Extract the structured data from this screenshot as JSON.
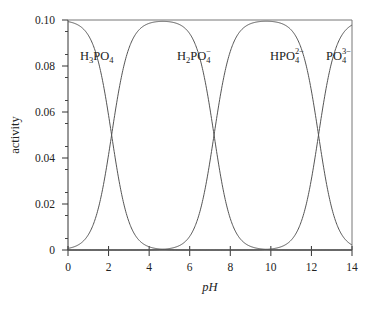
{
  "chart_data": {
    "type": "line",
    "title": "",
    "xlabel": "pH",
    "ylabel": "activity",
    "xlim": [
      0,
      14
    ],
    "ylim": [
      0,
      0.1
    ],
    "grid": false,
    "legend": "inline labels",
    "x_ticks": [
      0,
      2,
      4,
      6,
      8,
      10,
      12,
      14
    ],
    "x_tick_labels": [
      "0",
      "2",
      "4",
      "6",
      "8",
      "10",
      "12",
      "14"
    ],
    "y_ticks": [
      0,
      0.02,
      0.04,
      0.06,
      0.08,
      0.1
    ],
    "y_tick_labels": [
      "0",
      "0.02",
      "0.04",
      "0.06",
      "0.08",
      "0.10"
    ],
    "total_concentration": 0.1,
    "pKa": [
      2.15,
      7.2,
      12.35
    ],
    "series": [
      {
        "name": "H3PO4",
        "label_main": "H",
        "label_sub1": "3",
        "label_mid": "PO",
        "label_sub2": "4",
        "label_sup": "",
        "x": [
          0,
          1,
          2,
          2.15,
          3,
          4,
          5,
          6,
          7,
          8,
          10,
          12,
          14
        ],
        "values": [
          0.0993,
          0.0934,
          0.0585,
          0.05,
          0.0124,
          0.0014,
          0.0001,
          0.0,
          0.0,
          0.0,
          0.0,
          0.0,
          0.0
        ]
      },
      {
        "name": "H2PO4-",
        "label_main": "H",
        "label_sub1": "2",
        "label_mid": "PO",
        "label_sub2": "4",
        "label_sup": "−",
        "x": [
          0,
          1,
          2,
          2.15,
          3,
          4,
          4.7,
          6,
          7,
          7.2,
          8,
          9,
          10,
          12,
          14
        ],
        "values": [
          0.0007,
          0.0066,
          0.0415,
          0.05,
          0.0876,
          0.0985,
          0.0994,
          0.0939,
          0.0613,
          0.05,
          0.0137,
          0.0016,
          0.0002,
          0.0,
          0.0
        ]
      },
      {
        "name": "HPO4 2-",
        "label_main": "H",
        "label_sub1": "",
        "label_mid": "PO",
        "label_sub2": "4",
        "label_sup": "2−",
        "x": [
          0,
          4,
          5,
          6,
          7,
          7.2,
          8,
          9,
          9.8,
          11,
          12,
          12.35,
          13,
          14
        ],
        "values": [
          0.0,
          0.0001,
          0.0006,
          0.0059,
          0.0387,
          0.05,
          0.0863,
          0.0984,
          0.0991,
          0.0957,
          0.0691,
          0.05,
          0.0183,
          0.0022
        ]
      },
      {
        "name": "PO4 3-",
        "label_main": "",
        "label_sub1": "",
        "label_mid": "PO",
        "label_sub2": "4",
        "label_sup": "3−",
        "x": [
          0,
          9,
          10,
          11,
          12,
          12.35,
          13,
          14
        ],
        "values": [
          0.0,
          0.0,
          0.0004,
          0.0043,
          0.0309,
          0.05,
          0.0817,
          0.0978
        ]
      }
    ]
  },
  "labels": {
    "ylabel": "activity",
    "xlabel": "pH"
  }
}
